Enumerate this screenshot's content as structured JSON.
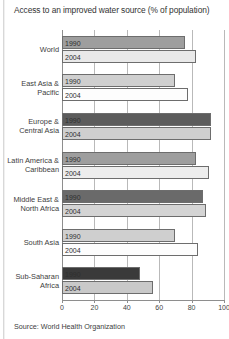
{
  "chart_data": {
    "type": "bar",
    "orientation": "horizontal",
    "title": "Access to an improved water source (% of population)",
    "xlabel": "",
    "ylabel": "",
    "xlim": [
      0,
      100
    ],
    "xticks": [
      0,
      20,
      40,
      60,
      80,
      100
    ],
    "grid": true,
    "legend": "none",
    "bar_value_labels_inside": true,
    "categories": [
      "World",
      "East Asia &\nPacific",
      "Europe &\nCentral Asia",
      "Latin America &\nCaribbean",
      "Middle East &\nNorth Africa",
      "South Asia",
      "Sub-Saharan\nAfrica"
    ],
    "series": [
      {
        "name": "1990",
        "values": [
          76,
          70,
          92,
          83,
          87,
          70,
          48
        ]
      },
      {
        "name": "2004",
        "values": [
          83,
          78,
          92,
          91,
          89,
          84,
          56
        ]
      }
    ],
    "bar_colors": [
      {
        "series_1990": "#9e9e9e",
        "series_2004": "#e9e9e9"
      },
      {
        "series_1990": "#cfcfcf",
        "series_2004": "#fdfdfd"
      },
      {
        "series_1990": "#5c5c5c",
        "series_2004": "#cfcfcf"
      },
      {
        "series_1990": "#9e9e9e",
        "series_2004": "#ededed"
      },
      {
        "series_1990": "#6a6a6a",
        "series_2004": "#d4d4d4"
      },
      {
        "series_1990": "#cfcfcf",
        "series_2004": "#fdfdfd"
      },
      {
        "series_1990": "#3a3a3a",
        "series_2004": "#c9c9c9"
      }
    ],
    "source": "Source: World Health Organization"
  },
  "axis": {
    "tick_labels": [
      "0",
      "20",
      "40",
      "60",
      "80",
      "100"
    ]
  },
  "footer": {
    "source": "Source: World Health Organization"
  }
}
